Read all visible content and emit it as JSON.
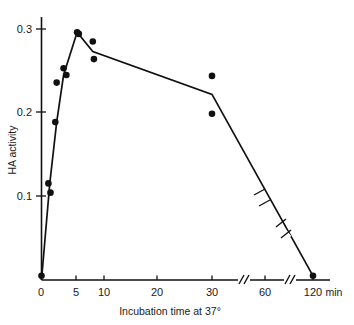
{
  "chart_data": {
    "type": "line",
    "title": "",
    "subtitle": "",
    "xlabel": "Incubation time at 37°",
    "ylabel": "HA activity",
    "x_unit": "min",
    "xticks": [
      0,
      5,
      10,
      20,
      30,
      60,
      120
    ],
    "xtick_labels": [
      "0",
      "5",
      "10",
      "20",
      "30",
      "60",
      "120"
    ],
    "yticks": [
      0.1,
      0.2,
      0.3
    ],
    "ytick_labels": [
      "0.1",
      "0.2",
      "0.3"
    ],
    "xlim": [
      0,
      125
    ],
    "ylim": [
      0,
      0.315
    ],
    "grid": false,
    "legend": null,
    "axis_breaks_x": [
      45,
      90
    ],
    "line_breaks": [
      [
        85,
        0.115
      ],
      [
        100,
        0.062
      ]
    ],
    "series": [
      {
        "name": "HA activity",
        "marker": "filled-circle",
        "line_x": [
          0,
          1.2,
          2.2,
          3.2,
          5.2,
          8.0,
          30.0,
          120.0
        ],
        "line_y": [
          0.0,
          0.115,
          0.188,
          0.244,
          0.295,
          0.272,
          0.221,
          0.005
        ],
        "points_x": [
          0,
          1.0,
          1.3,
          2.0,
          2.2,
          3.2,
          3.6,
          5.2,
          5.5,
          8.0,
          8.2,
          30.0,
          30.0,
          120.0
        ],
        "points_y": [
          0.005,
          0.115,
          0.104,
          0.188,
          0.235,
          0.252,
          0.244,
          0.295,
          0.293,
          0.284,
          0.263,
          0.243,
          0.198,
          0.005
        ]
      }
    ]
  },
  "figure": {
    "x_axis_title": "Incubation time at 37°",
    "y_axis_title": "HA activity",
    "x_unit_text": "min",
    "x_labels": [
      "0",
      "5",
      "10",
      "20",
      "30",
      "60",
      "120"
    ],
    "y_labels": [
      "0.1",
      "0.2",
      "0.3"
    ],
    "ink_color": "#111111",
    "background_color": "#ffffff"
  }
}
